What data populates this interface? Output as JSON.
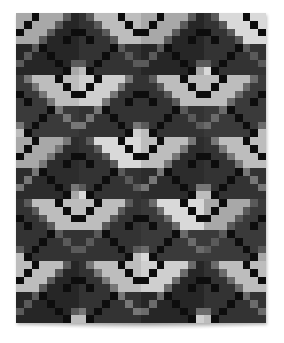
{
  "image": {
    "subject": "black-and-white patchwork quilt",
    "quilt": {
      "cols": 32,
      "rows": 40,
      "tile_size": 8,
      "palette": {
        "black": "#0d0d0d",
        "dark": [
          "#262626",
          "#333333",
          "#2c2c2c",
          "#3a3a3a"
        ],
        "mid": [
          "#5a5a5a",
          "#6b6b6b",
          "#777777"
        ],
        "light": [
          "#a8a8a8",
          "#bdbdbd",
          "#cfcfcf",
          "#d9d9d9"
        ]
      },
      "tile": [
        "LLBLLLMD",
        "LBLLLMDD",
        "BLLLMDDB",
        "LLLMDDBD",
        "DDMBDDDD",
        "DMDDBDDD",
        "MDDDDBDM",
        "DDDDDDBL"
      ]
    }
  }
}
